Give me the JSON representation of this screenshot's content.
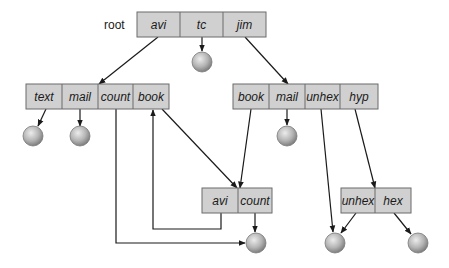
{
  "diagram": {
    "root_label": "root",
    "nodes": [
      {
        "id": "root",
        "x": 137,
        "y": 12,
        "h": 25,
        "cells": [
          {
            "label": "avi",
            "w": 43
          },
          {
            "label": "tc",
            "w": 43
          },
          {
            "label": "jim",
            "w": 43
          }
        ]
      },
      {
        "id": "avi_dir",
        "x": 26,
        "y": 84,
        "h": 25,
        "cells": [
          {
            "label": "text",
            "w": 36
          },
          {
            "label": "mail",
            "w": 36
          },
          {
            "label": "count",
            "w": 35
          },
          {
            "label": "book",
            "w": 36
          }
        ]
      },
      {
        "id": "jim_dir",
        "x": 233,
        "y": 84,
        "h": 25,
        "cells": [
          {
            "label": "book",
            "w": 36
          },
          {
            "label": "mail",
            "w": 36
          },
          {
            "label": "unhex",
            "w": 35
          },
          {
            "label": "hyp",
            "w": 38
          }
        ]
      },
      {
        "id": "book_dir",
        "x": 202,
        "y": 188,
        "h": 25,
        "cells": [
          {
            "label": "avi",
            "w": 36
          },
          {
            "label": "count",
            "w": 34
          }
        ]
      },
      {
        "id": "hyp_dir",
        "x": 341,
        "y": 188,
        "h": 25,
        "cells": [
          {
            "label": "unhex",
            "w": 34
          },
          {
            "label": "hex",
            "w": 36
          }
        ]
      }
    ],
    "files": [
      {
        "id": "tc_file",
        "cx": 202,
        "cy": 62
      },
      {
        "id": "text_file",
        "cx": 33,
        "cy": 136
      },
      {
        "id": "mail_file_avi",
        "cx": 80,
        "cy": 136
      },
      {
        "id": "mail_file_jim",
        "cx": 287,
        "cy": 136
      },
      {
        "id": "count_file",
        "cx": 256,
        "cy": 243
      },
      {
        "id": "unhex_file",
        "cx": 335,
        "cy": 243
      },
      {
        "id": "hex_file",
        "cx": 418,
        "cy": 243
      }
    ],
    "file_radius": 10,
    "edges": [
      {
        "from": "root.avi",
        "points": [
          [
            158,
            37
          ],
          [
            99,
            84
          ]
        ]
      },
      {
        "from": "root.tc",
        "points": [
          [
            202,
            37
          ],
          [
            202,
            51
          ]
        ]
      },
      {
        "from": "root.jim",
        "points": [
          [
            245,
            37
          ],
          [
            288,
            84
          ]
        ]
      },
      {
        "from": "avi_dir.text",
        "points": [
          [
            46,
            109
          ],
          [
            38,
            126
          ]
        ]
      },
      {
        "from": "avi_dir.mail",
        "points": [
          [
            80,
            109
          ],
          [
            80,
            126
          ]
        ]
      },
      {
        "from": "avi_dir.count",
        "points": [
          [
            116,
            109
          ],
          [
            116,
            243
          ],
          [
            245,
            243
          ]
        ]
      },
      {
        "from": "avi_dir.book",
        "points": [
          [
            162,
            109
          ],
          [
            237,
            188
          ]
        ]
      },
      {
        "from": "jim_dir.book",
        "points": [
          [
            251,
            109
          ],
          [
            240,
            188
          ]
        ]
      },
      {
        "from": "jim_dir.mail",
        "points": [
          [
            287,
            109
          ],
          [
            287,
            125
          ]
        ]
      },
      {
        "from": "jim_dir.unhex",
        "points": [
          [
            321,
            109
          ],
          [
            333,
            232
          ]
        ]
      },
      {
        "from": "jim_dir.hyp",
        "points": [
          [
            355,
            109
          ],
          [
            375,
            188
          ]
        ]
      },
      {
        "from": "book_dir.avi",
        "points": [
          [
            221,
            213
          ],
          [
            221,
            229
          ],
          [
            153,
            229
          ],
          [
            153,
            110
          ]
        ]
      },
      {
        "from": "book_dir.count",
        "points": [
          [
            255,
            213
          ],
          [
            255,
            232
          ]
        ]
      },
      {
        "from": "hyp_dir.unhex",
        "points": [
          [
            356,
            213
          ],
          [
            341,
            233
          ]
        ]
      },
      {
        "from": "hyp_dir.hex",
        "points": [
          [
            394,
            213
          ],
          [
            411,
            234
          ]
        ]
      }
    ],
    "colors": {
      "box_fill": "#d0d0d0",
      "box_border": "#6b6b6b",
      "edge": "#1a1a1a",
      "file_light": "#e8e8e8",
      "file_dark": "#8a8a8a"
    }
  }
}
